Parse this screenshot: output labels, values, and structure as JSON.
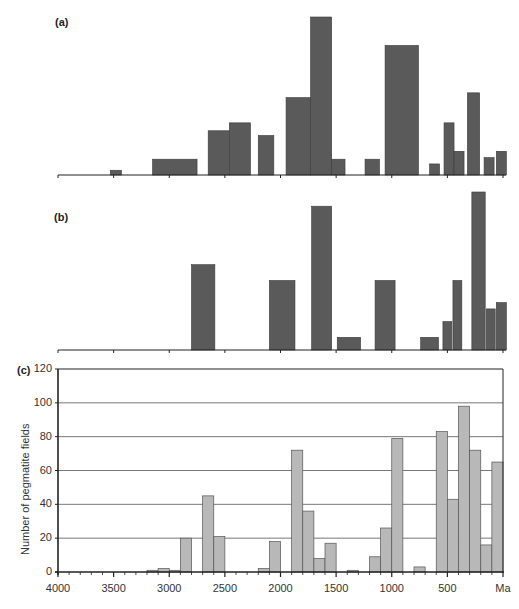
{
  "figure": {
    "panel_a_label": "(a)",
    "panel_b_label": "(b)",
    "panel_c_label": "(c)",
    "ylabel": "Number of pegmatite fields",
    "x_ticks": [
      "4000",
      "3500",
      "3000",
      "2500",
      "2000",
      "1500",
      "1000",
      "500",
      "Ma"
    ],
    "y_ticks": [
      "0",
      "20",
      "40",
      "60",
      "80",
      "100",
      "120"
    ],
    "colors": {
      "panel_ab_bar": "#5a5a5a",
      "panel_c_bar": "#b8b8b8",
      "axis": "#222222",
      "grid": "#555555"
    }
  },
  "chart_data": [
    {
      "type": "bar",
      "panel": "a",
      "title": "(a)",
      "xlabel": "",
      "ylabel": "",
      "x_unit": "Ma",
      "xlim": [
        4000,
        0
      ],
      "y_axis": "unlabeled (relative height)",
      "bars": [
        {
          "from": 3530,
          "to": 3430,
          "rel_height": 0.03
        },
        {
          "from": 3150,
          "to": 2750,
          "rel_height": 0.1
        },
        {
          "from": 2650,
          "to": 2460,
          "rel_height": 0.28
        },
        {
          "from": 2460,
          "to": 2270,
          "rel_height": 0.33
        },
        {
          "from": 2200,
          "to": 2060,
          "rel_height": 0.25
        },
        {
          "from": 1950,
          "to": 1730,
          "rel_height": 0.49
        },
        {
          "from": 1730,
          "to": 1540,
          "rel_height": 1.0
        },
        {
          "from": 1540,
          "to": 1420,
          "rel_height": 0.1
        },
        {
          "from": 1240,
          "to": 1110,
          "rel_height": 0.1
        },
        {
          "from": 1060,
          "to": 760,
          "rel_height": 0.82
        },
        {
          "from": 660,
          "to": 570,
          "rel_height": 0.07
        },
        {
          "from": 530,
          "to": 440,
          "rel_height": 0.33
        },
        {
          "from": 440,
          "to": 350,
          "rel_height": 0.15
        },
        {
          "from": 320,
          "to": 210,
          "rel_height": 0.52
        },
        {
          "from": 170,
          "to": 80,
          "rel_height": 0.11
        },
        {
          "from": 60,
          "to": -30,
          "rel_height": 0.15
        }
      ]
    },
    {
      "type": "bar",
      "panel": "b",
      "title": "(b)",
      "xlabel": "",
      "ylabel": "",
      "x_unit": "Ma",
      "xlim": [
        4000,
        0
      ],
      "y_axis": "unlabeled (relative height)",
      "bars": [
        {
          "from": 2800,
          "to": 2590,
          "rel_height": 0.54
        },
        {
          "from": 2100,
          "to": 1870,
          "rel_height": 0.44
        },
        {
          "from": 1720,
          "to": 1540,
          "rel_height": 0.91
        },
        {
          "from": 1490,
          "to": 1280,
          "rel_height": 0.08
        },
        {
          "from": 1150,
          "to": 970,
          "rel_height": 0.44
        },
        {
          "from": 740,
          "to": 580,
          "rel_height": 0.08
        },
        {
          "from": 540,
          "to": 460,
          "rel_height": 0.18
        },
        {
          "from": 450,
          "to": 370,
          "rel_height": 0.44
        },
        {
          "from": 280,
          "to": 160,
          "rel_height": 1.0
        },
        {
          "from": 150,
          "to": 70,
          "rel_height": 0.26
        },
        {
          "from": 60,
          "to": -30,
          "rel_height": 0.3
        }
      ]
    },
    {
      "type": "bar",
      "panel": "c",
      "title": "(c)",
      "xlabel": "Ma",
      "ylabel": "Number of pegmatite fields",
      "xlim": [
        4000,
        0
      ],
      "ylim": [
        0,
        120
      ],
      "grid": true,
      "bin_width_Ma": 100,
      "categories": [
        "3200-3100",
        "3100-3000",
        "3000-2900",
        "2900-2800",
        "2800-2700",
        "2700-2600",
        "2600-2500",
        "2500-2400",
        "2400-2300",
        "2300-2200",
        "2200-2100",
        "2100-2000",
        "2000-1900",
        "1900-1800",
        "1800-1700",
        "1700-1600",
        "1600-1500",
        "1500-1400",
        "1400-1300",
        "1300-1200",
        "1200-1100",
        "1100-1000",
        "1000-900",
        "900-800",
        "800-700",
        "700-600",
        "600-500",
        "500-400",
        "400-300",
        "300-200",
        "200-100",
        "100-0"
      ],
      "values": [
        1,
        2,
        1,
        20,
        0,
        45,
        21,
        0,
        0,
        0,
        2,
        18,
        0,
        72,
        36,
        8,
        17,
        0,
        1,
        0,
        9,
        26,
        79,
        0,
        3,
        0,
        83,
        43,
        98,
        72,
        16,
        65
      ]
    }
  ]
}
